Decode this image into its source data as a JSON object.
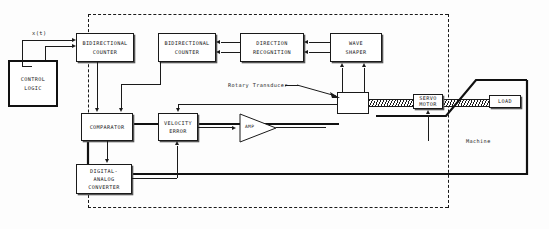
{
  "diagram": {
    "background": "#fdfdfd",
    "line_color": "#1a1a1a",
    "boundary": {
      "name": "control-system-boundary",
      "style": "dashed"
    },
    "signals": {
      "input_label": "x(t)"
    },
    "blocks": {
      "control_logic": "CONTROL\nLOGIC",
      "control_logic_l1": "CONTROL",
      "control_logic_l2": "LOGIC",
      "bidirectional_counter_1_l1": "BIDIRECTIONAL",
      "bidirectional_counter_1_l2": "COUNTER",
      "bidirectional_counter_2_l1": "BIDIRECTIONAL",
      "bidirectional_counter_2_l2": "COUNTER",
      "direction_recognition_l1": "DIRECTION",
      "direction_recognition_l2": "RECOGNITION",
      "wave_shaper_l1": "WAVE",
      "wave_shaper_l2": "SHAPER",
      "comparator": "COMPARATOR",
      "digital_analog_converter_l1": "DIGITAL-",
      "digital_analog_converter_l2": "ANALOG",
      "digital_analog_converter_l3": "CONVERTER",
      "velocity_error_l1": "VELOCITY",
      "velocity_error_l2": "ERROR",
      "amplifier": "AMP",
      "servo_motor_l1": "SERVO",
      "servo_motor_l2": "MOTOR",
      "load": "LOAD",
      "transducer_box": ""
    },
    "annotations": {
      "rotary_transducer": "Rotary Transducer",
      "machine": "Machine"
    }
  }
}
